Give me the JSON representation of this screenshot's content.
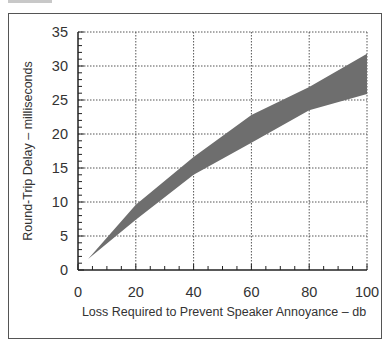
{
  "chart_data": {
    "type": "area",
    "title": "",
    "xlabel": "Loss Required to Prevent Speaker Annoyance – db",
    "ylabel": "Round-Trip Delay – milliseconds",
    "xlim": [
      0,
      100
    ],
    "ylim": [
      0,
      35
    ],
    "x_ticks": [
      "0",
      "20",
      "40",
      "60",
      "80",
      "100"
    ],
    "y_ticks": [
      "0",
      "5",
      "10",
      "15",
      "20",
      "25",
      "30",
      "35"
    ],
    "grid": true,
    "legend": null,
    "series": [
      {
        "name": "upper bound",
        "x": [
          3.5,
          20,
          40,
          60,
          80,
          100
        ],
        "values": [
          1.6,
          9.6,
          16.6,
          22.8,
          26.9,
          31.8
        ]
      },
      {
        "name": "lower bound",
        "x": [
          3.5,
          20,
          40,
          60,
          80,
          100
        ],
        "values": [
          1.6,
          7.4,
          14.0,
          18.7,
          23.5,
          25.9
        ]
      }
    ],
    "fill_color": "#6e6e6e"
  }
}
